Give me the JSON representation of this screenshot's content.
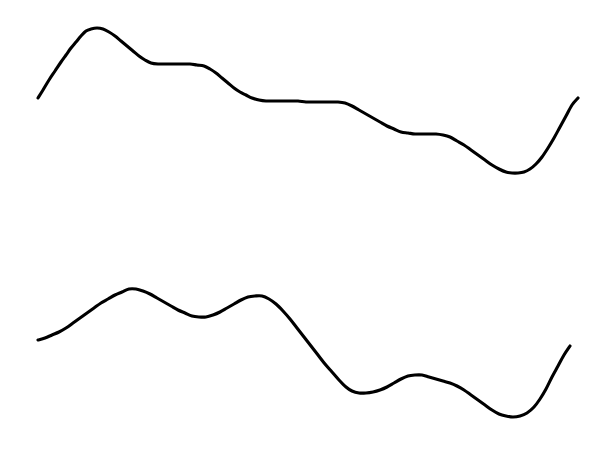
{
  "canvas": {
    "width": 602,
    "height": 458,
    "background_color": "#ffffff",
    "title": "Two hand-drawn wavy curves"
  },
  "style": {
    "stroke_color": "#000000",
    "stroke_width": 3.1,
    "line_cap": "round",
    "line_join": "round"
  },
  "chart_data": {
    "type": "line",
    "title": "",
    "subtitle": "",
    "xlabel": "",
    "ylabel": "",
    "xlim": [
      0,
      602
    ],
    "ylim": [
      458,
      0
    ],
    "grid": false,
    "legend": "none",
    "axes_visible": false,
    "tick_labels_x": [],
    "tick_labels_y": [],
    "annotations": [],
    "series": [
      {
        "name": "upper-curve",
        "points": [
          [
            38,
            98
          ],
          [
            43,
            90
          ],
          [
            49,
            80
          ],
          [
            55,
            71
          ],
          [
            61,
            62
          ],
          [
            66,
            55
          ],
          [
            71,
            48
          ],
          [
            76,
            42
          ],
          [
            81,
            36
          ],
          [
            86,
            31
          ],
          [
            91,
            29
          ],
          [
            97,
            28
          ],
          [
            103,
            29
          ],
          [
            109,
            32
          ],
          [
            115,
            36
          ],
          [
            121,
            41
          ],
          [
            127,
            46
          ],
          [
            133,
            51
          ],
          [
            139,
            56
          ],
          [
            145,
            60
          ],
          [
            151,
            63
          ],
          [
            158,
            64
          ],
          [
            166,
            64
          ],
          [
            174,
            64
          ],
          [
            182,
            64
          ],
          [
            190,
            64
          ],
          [
            197,
            65
          ],
          [
            204,
            66
          ],
          [
            210,
            69
          ],
          [
            216,
            73
          ],
          [
            222,
            78
          ],
          [
            228,
            83
          ],
          [
            234,
            88
          ],
          [
            240,
            92
          ],
          [
            246,
            95
          ],
          [
            252,
            98
          ],
          [
            259,
            100
          ],
          [
            266,
            101
          ],
          [
            274,
            101
          ],
          [
            282,
            101
          ],
          [
            290,
            101
          ],
          [
            298,
            101
          ],
          [
            306,
            102
          ],
          [
            314,
            102
          ],
          [
            322,
            102
          ],
          [
            330,
            102
          ],
          [
            338,
            102
          ],
          [
            345,
            103
          ],
          [
            352,
            106
          ],
          [
            359,
            110
          ],
          [
            366,
            114
          ],
          [
            373,
            118
          ],
          [
            380,
            122
          ],
          [
            387,
            126
          ],
          [
            394,
            129
          ],
          [
            401,
            132
          ],
          [
            408,
            133
          ],
          [
            415,
            134
          ],
          [
            422,
            134
          ],
          [
            429,
            134
          ],
          [
            436,
            134
          ],
          [
            443,
            135
          ],
          [
            450,
            137
          ],
          [
            457,
            141
          ],
          [
            464,
            145
          ],
          [
            471,
            150
          ],
          [
            478,
            155
          ],
          [
            485,
            160
          ],
          [
            492,
            165
          ],
          [
            499,
            169
          ],
          [
            506,
            172
          ],
          [
            512,
            173
          ],
          [
            518,
            173
          ],
          [
            524,
            172
          ],
          [
            530,
            169
          ],
          [
            536,
            164
          ],
          [
            542,
            157
          ],
          [
            548,
            148
          ],
          [
            554,
            138
          ],
          [
            560,
            127
          ],
          [
            566,
            116
          ],
          [
            572,
            105
          ],
          [
            578,
            98
          ]
        ]
      },
      {
        "name": "lower-curve",
        "points": [
          [
            38,
            340
          ],
          [
            45,
            338
          ],
          [
            52,
            335
          ],
          [
            59,
            332
          ],
          [
            66,
            328
          ],
          [
            73,
            323
          ],
          [
            80,
            318
          ],
          [
            87,
            313
          ],
          [
            94,
            308
          ],
          [
            101,
            303
          ],
          [
            108,
            299
          ],
          [
            115,
            295
          ],
          [
            122,
            292
          ],
          [
            129,
            289
          ],
          [
            136,
            289
          ],
          [
            143,
            291
          ],
          [
            150,
            294
          ],
          [
            157,
            298
          ],
          [
            164,
            302
          ],
          [
            171,
            306
          ],
          [
            178,
            310
          ],
          [
            185,
            313
          ],
          [
            192,
            316
          ],
          [
            199,
            317
          ],
          [
            206,
            317
          ],
          [
            213,
            315
          ],
          [
            220,
            312
          ],
          [
            227,
            308
          ],
          [
            234,
            304
          ],
          [
            241,
            300
          ],
          [
            248,
            297
          ],
          [
            255,
            296
          ],
          [
            262,
            296
          ],
          [
            269,
            299
          ],
          [
            276,
            304
          ],
          [
            283,
            311
          ],
          [
            290,
            319
          ],
          [
            297,
            328
          ],
          [
            304,
            337
          ],
          [
            311,
            346
          ],
          [
            318,
            355
          ],
          [
            325,
            364
          ],
          [
            332,
            372
          ],
          [
            339,
            380
          ],
          [
            346,
            387
          ],
          [
            352,
            391
          ],
          [
            359,
            393
          ],
          [
            366,
            393
          ],
          [
            373,
            392
          ],
          [
            380,
            390
          ],
          [
            387,
            387
          ],
          [
            394,
            383
          ],
          [
            401,
            379
          ],
          [
            408,
            376
          ],
          [
            415,
            375
          ],
          [
            422,
            375
          ],
          [
            429,
            377
          ],
          [
            436,
            379
          ],
          [
            443,
            381
          ],
          [
            450,
            383
          ],
          [
            457,
            386
          ],
          [
            464,
            390
          ],
          [
            471,
            395
          ],
          [
            478,
            400
          ],
          [
            485,
            405
          ],
          [
            492,
            410
          ],
          [
            499,
            414
          ],
          [
            506,
            416
          ],
          [
            513,
            417
          ],
          [
            520,
            416
          ],
          [
            527,
            413
          ],
          [
            534,
            407
          ],
          [
            540,
            399
          ],
          [
            546,
            389
          ],
          [
            552,
            377
          ],
          [
            558,
            366
          ],
          [
            564,
            355
          ],
          [
            570,
            346
          ]
        ]
      }
    ]
  }
}
